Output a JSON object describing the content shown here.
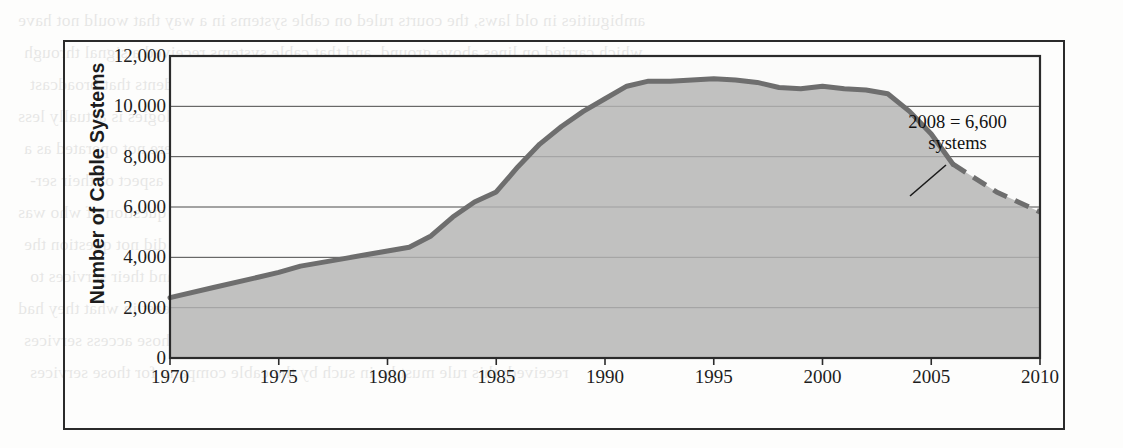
{
  "figure": {
    "y_axis_title": "Number of Cable Systems",
    "annotation_line1": "2008 = 6,600",
    "annotation_line2": "systems"
  },
  "bleed_text": [
    "ambiguities in old laws, the courts ruled on cable systems in a way that would not have",
    "which carried on lines above ground, and that cable systems received a signal through",
    "companies and the satellite television stations and legal precedents that broadcast",
    "broadcast companies claimed viewing rights. Ownership of technologies is actually less",
    "it applies. Cable systems could claim no carrier of services if they were not operated as a",
    "computer services had been to carry a communication to every channel aspect of their ser-",
    "vice. In the 1970s and the appearance of the cable providers, and the question of who was",
    "not involved in channel content. Cable telephone systems carried who did not question the",
    "personal systems using GTE for the cable reception and the channels and their services to",
    "receive (2) cable companies at the FCC argued; should offer a least in what they had",
    "a response, first-served basis to who were coming at the time. For those access services",
    "received; this rule must be in such by the cable company for those services"
  ],
  "chart_data": {
    "type": "area",
    "title": "",
    "xlabel": "",
    "ylabel": "Number of Cable Systems",
    "xlim": [
      1970,
      2010
    ],
    "ylim": [
      0,
      12000
    ],
    "x_ticks": [
      1970,
      1975,
      1980,
      1985,
      1990,
      1995,
      2000,
      2005,
      2010
    ],
    "y_ticks": [
      0,
      2000,
      4000,
      6000,
      8000,
      10000,
      12000
    ],
    "y_tick_labels": [
      "0",
      "2,000",
      "4,000",
      "6,000",
      "8,000",
      "10,000",
      "12,000"
    ],
    "grid": "horizontal",
    "legend": "none",
    "fill_color": "#b3b3b3",
    "line_color": "#6e6e6e",
    "series": [
      {
        "name": "Number of Cable Systems (actual)",
        "style": "solid",
        "x": [
          1970,
          1972,
          1974,
          1975,
          1976,
          1977,
          1978,
          1979,
          1980,
          1981,
          1982,
          1983,
          1984,
          1985,
          1986,
          1987,
          1988,
          1989,
          1990,
          1991,
          1992,
          1993,
          1994,
          1995,
          1996,
          1997,
          1998,
          1999,
          2000,
          2001,
          2002,
          2003,
          2004,
          2005,
          2006
        ],
        "y": [
          2400,
          2800,
          3200,
          3400,
          3650,
          3800,
          3950,
          4100,
          4250,
          4400,
          4850,
          5600,
          6200,
          6600,
          7600,
          8500,
          9200,
          9800,
          10300,
          10800,
          11000,
          11000,
          11050,
          11100,
          11050,
          10950,
          10750,
          10700,
          10800,
          10700,
          10650,
          10500,
          9800,
          8900,
          7700
        ]
      },
      {
        "name": "Number of Cable Systems (projected)",
        "style": "dashed",
        "x": [
          2006,
          2007,
          2008,
          2009,
          2010
        ],
        "y": [
          7700,
          7150,
          6600,
          6200,
          5800
        ]
      }
    ],
    "annotations": [
      {
        "text": "2008 = 6,600 systems",
        "point_x": 2008,
        "point_y": 6600
      }
    ]
  }
}
